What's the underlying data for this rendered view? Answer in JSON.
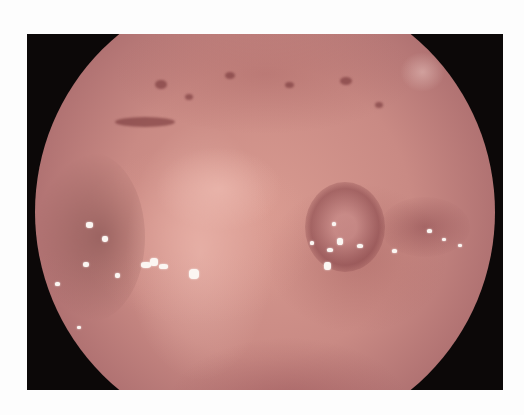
{
  "image": {
    "subject": "endoscopic view of mucosal tissue with raised lesions and white exudate",
    "colors": {
      "background": "#fdfdfd",
      "frame": "#0c0808",
      "tissue_base": "#c98a84",
      "tissue_light": "#e8b4a8",
      "tissue_dark": "#8a5256",
      "exudate": "#fbf6f2"
    }
  }
}
